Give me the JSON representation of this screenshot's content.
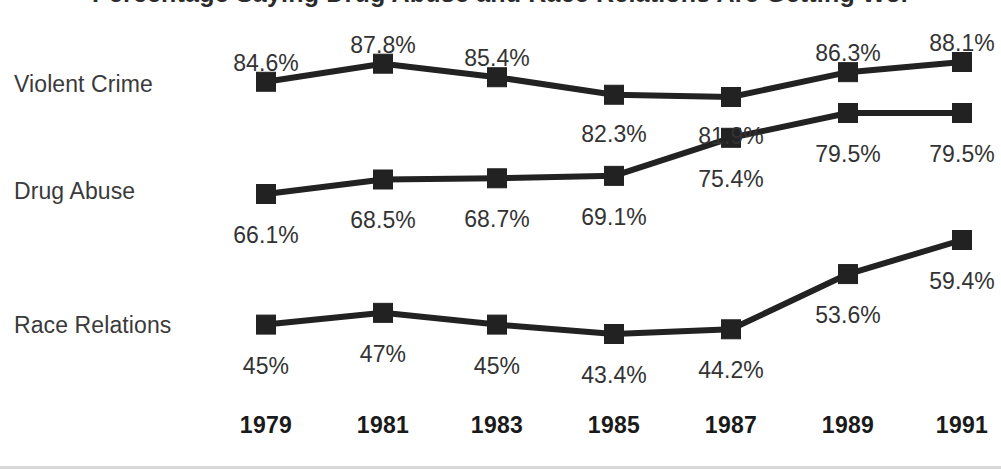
{
  "figure": {
    "title_cut_off": "Percentage Saying Drug Abuse and Race Relations Are Getting Worse",
    "background_color": "#ffffff",
    "ink_color": "#222222"
  },
  "chart_data": {
    "type": "line",
    "title": "",
    "xlabel": "",
    "ylabel": "",
    "grid": false,
    "legend_position": "left-row-labels",
    "categories": [
      "1979",
      "1981",
      "1983",
      "1985",
      "1987",
      "1989",
      "1991"
    ],
    "series": [
      {
        "name": "Violent Crime",
        "values": [
          84.6,
          87.8,
          85.4,
          82.3,
          81.9,
          86.3,
          88.1
        ],
        "labels": [
          "84.6%",
          "87.8%",
          "85.4%",
          "82.3%",
          "81.9%",
          "86.3%",
          "88.1%"
        ],
        "label_side": [
          "above",
          "above",
          "above",
          "below",
          "below",
          "above",
          "above"
        ]
      },
      {
        "name": "Drug Abuse",
        "values": [
          66.1,
          68.5,
          68.7,
          69.1,
          75.4,
          79.5,
          79.5
        ],
        "labels": [
          "66.1%",
          "68.5%",
          "68.7%",
          "69.1%",
          "75.4%",
          "79.5%",
          "79.5%"
        ],
        "label_side": [
          "below",
          "below",
          "below",
          "below",
          "below",
          "below",
          "below"
        ]
      },
      {
        "name": "Race Relations",
        "values": [
          45.0,
          47.0,
          45.0,
          43.4,
          44.2,
          53.6,
          59.4
        ],
        "labels": [
          "45%",
          "47%",
          "45%",
          "43.4%",
          "44.2%",
          "53.6%",
          "59.4%"
        ],
        "label_side": [
          "below",
          "below",
          "below",
          "below",
          "below",
          "below",
          "below"
        ]
      }
    ],
    "marker": "filled-square",
    "marker_color": "#222222",
    "line_color": "#222222"
  },
  "axis": {
    "years": [
      "1979",
      "1981",
      "1983",
      "1985",
      "1987",
      "1989",
      "1991"
    ]
  }
}
